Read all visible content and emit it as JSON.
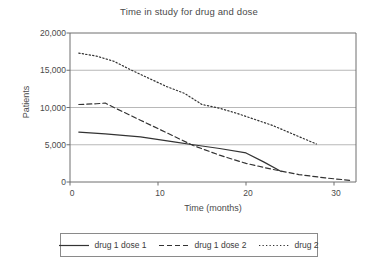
{
  "chart_data": {
    "type": "line",
    "title": "Time in study for drug and dose",
    "xlabel": "Time  (months)",
    "ylabel": "Patients",
    "xlim": [
      0,
      32.5
    ],
    "ylim": [
      0,
      20000
    ],
    "xticks": [
      "0",
      "10",
      "20",
      "30"
    ],
    "xtick_values": [
      0,
      10,
      20,
      30
    ],
    "yticks": [
      "0",
      "5,000",
      "10,000",
      "15,000",
      "20,000"
    ],
    "ytick_values": [
      0,
      5000,
      10000,
      15000,
      20000
    ],
    "grid": "horizontal",
    "legend_position": "below",
    "series": [
      {
        "name": "drug 1 dose 1",
        "style": "solid",
        "color": "#333333",
        "points": [
          {
            "x": 1,
            "y": 6700
          },
          {
            "x": 4,
            "y": 6450
          },
          {
            "x": 8,
            "y": 6050
          },
          {
            "x": 12,
            "y": 5350
          },
          {
            "x": 14,
            "y": 5000
          },
          {
            "x": 17,
            "y": 4500
          },
          {
            "x": 20,
            "y": 3900
          },
          {
            "x": 22,
            "y": 2700
          },
          {
            "x": 24,
            "y": 1400
          }
        ]
      },
      {
        "name": "drug 1 dose 2",
        "style": "dashed",
        "color": "#333333",
        "points": [
          {
            "x": 1,
            "y": 10400
          },
          {
            "x": 3,
            "y": 10500
          },
          {
            "x": 4,
            "y": 10600
          },
          {
            "x": 5,
            "y": 10000
          },
          {
            "x": 8,
            "y": 8300
          },
          {
            "x": 11,
            "y": 6600
          },
          {
            "x": 14,
            "y": 4900
          },
          {
            "x": 17,
            "y": 3600
          },
          {
            "x": 20,
            "y": 2500
          },
          {
            "x": 23,
            "y": 1700
          },
          {
            "x": 26,
            "y": 1000
          },
          {
            "x": 29,
            "y": 550
          },
          {
            "x": 32,
            "y": 200
          }
        ]
      },
      {
        "name": "drug 2",
        "style": "dotted",
        "color": "#333333",
        "points": [
          {
            "x": 1,
            "y": 17300
          },
          {
            "x": 3,
            "y": 16900
          },
          {
            "x": 5,
            "y": 16200
          },
          {
            "x": 7,
            "y": 15000
          },
          {
            "x": 9,
            "y": 13900
          },
          {
            "x": 11,
            "y": 12800
          },
          {
            "x": 13,
            "y": 11900
          },
          {
            "x": 15,
            "y": 10400
          },
          {
            "x": 17,
            "y": 9900
          },
          {
            "x": 19,
            "y": 9200
          },
          {
            "x": 21,
            "y": 8400
          },
          {
            "x": 23,
            "y": 7600
          },
          {
            "x": 25,
            "y": 6600
          },
          {
            "x": 27,
            "y": 5600
          },
          {
            "x": 28,
            "y": 5100
          }
        ]
      }
    ],
    "legend": [
      {
        "label": "drug 1 dose 1",
        "style": "solid"
      },
      {
        "label": "drug 1 dose 2",
        "style": "dashed"
      },
      {
        "label": "drug 2",
        "style": "dotted"
      }
    ]
  }
}
